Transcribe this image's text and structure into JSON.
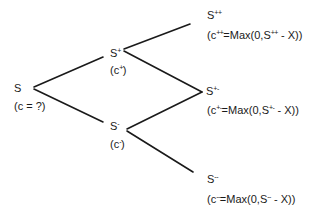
{
  "diagram": {
    "type": "binomial-tree",
    "colors": {
      "line": "#1a1a1a",
      "text": "#1a1a1a",
      "background": "#ffffff"
    },
    "nodes": {
      "root": {
        "stock": "S",
        "stock_sup": "",
        "option": "(c = ?)"
      },
      "up": {
        "stock": "S",
        "stock_sup": "+",
        "option_pre": "(c",
        "option_sup": "+",
        "option_post": ")"
      },
      "down": {
        "stock": "S",
        "stock_sup": "-",
        "option_pre": "(c",
        "option_sup": "-",
        "option_post": ")"
      },
      "upup": {
        "stock": "S",
        "stock_sup": "++",
        "option_pre": "(c",
        "option_sup": "++",
        "option_mid": "=Max(0,S",
        "option_sup2": "++",
        "option_post": " - X))"
      },
      "updown": {
        "stock": "S",
        "stock_sup": "+-",
        "option_pre": "(c",
        "option_sup": "+-",
        "option_mid": "=Max(0,S",
        "option_sup2": "+-",
        "option_post": " - X))"
      },
      "downdown": {
        "stock": "S",
        "stock_sup": "--",
        "option_pre": "(c",
        "option_sup": "--",
        "option_mid": "=Max(0,S",
        "option_sup2": "--",
        "option_post": " - X))"
      }
    },
    "edges": [
      {
        "from": "root",
        "to": "up"
      },
      {
        "from": "root",
        "to": "down"
      },
      {
        "from": "up",
        "to": "upup"
      },
      {
        "from": "up",
        "to": "updown"
      },
      {
        "from": "down",
        "to": "updown"
      },
      {
        "from": "down",
        "to": "downdown"
      }
    ]
  }
}
